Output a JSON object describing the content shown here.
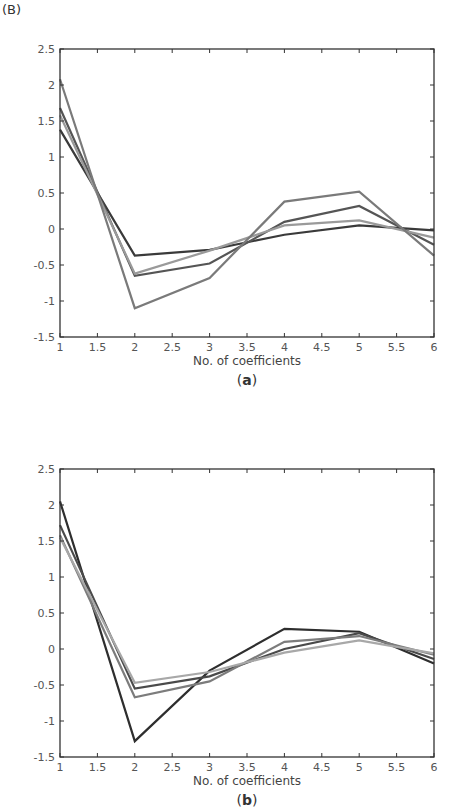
{
  "figure_label": "(B)",
  "chart_data": [
    {
      "type": "line",
      "caption": "(a)",
      "title": "",
      "xlabel": "No. of coefficients",
      "ylabel": "",
      "x": [
        1,
        2,
        3,
        4,
        5,
        6
      ],
      "xlim": [
        1,
        6
      ],
      "ylim": [
        -1.5,
        2.5
      ],
      "xticks": [
        "1",
        "1.5",
        "2",
        "2.5",
        "3",
        "3.5",
        "4",
        "4.5",
        "5",
        "5.5",
        "6"
      ],
      "yticks": [
        "2.5",
        "2",
        "1.5",
        "1",
        "0.5",
        "0",
        "-0.5",
        "-1",
        "-1.5"
      ],
      "grid": false,
      "legend": "none",
      "series": [
        {
          "name": "series-1",
          "color": "#3a3a3a",
          "values": [
            1.38,
            -0.37,
            -0.29,
            -0.08,
            0.05,
            -0.02
          ]
        },
        {
          "name": "series-2",
          "color": "#555555",
          "values": [
            1.68,
            -0.65,
            -0.48,
            0.1,
            0.32,
            -0.22
          ]
        },
        {
          "name": "series-3",
          "color": "#9a9a9a",
          "values": [
            1.58,
            -0.62,
            -0.3,
            0.05,
            0.12,
            -0.12
          ]
        },
        {
          "name": "series-4",
          "color": "#7a7a7a",
          "values": [
            2.08,
            -1.1,
            -0.68,
            0.38,
            0.52,
            -0.37
          ]
        }
      ]
    },
    {
      "type": "line",
      "caption": "(b)",
      "title": "",
      "xlabel": "No. of coefficients",
      "ylabel": "",
      "x": [
        1,
        2,
        3,
        4,
        5,
        6
      ],
      "xlim": [
        1,
        6
      ],
      "ylim": [
        -1.5,
        2.5
      ],
      "xticks": [
        "1",
        "1.5",
        "2",
        "2.5",
        "3",
        "3.5",
        "4",
        "4.5",
        "5",
        "5.5",
        "6"
      ],
      "yticks": [
        "2.5",
        "2",
        "1.5",
        "1",
        "0.5",
        "0",
        "-0.5",
        "-1",
        "-1.5"
      ],
      "grid": false,
      "legend": "none",
      "series": [
        {
          "name": "series-1",
          "color": "#2e2e2e",
          "values": [
            2.05,
            -1.28,
            -0.3,
            0.28,
            0.24,
            -0.2
          ]
        },
        {
          "name": "series-2",
          "color": "#4a4a4a",
          "values": [
            1.72,
            -0.55,
            -0.38,
            0.0,
            0.22,
            -0.14
          ]
        },
        {
          "name": "series-3",
          "color": "#7c7c7c",
          "values": [
            1.58,
            -0.67,
            -0.45,
            0.1,
            0.18,
            -0.08
          ]
        },
        {
          "name": "series-4",
          "color": "#a8a8a8",
          "values": [
            1.55,
            -0.47,
            -0.32,
            -0.05,
            0.12,
            -0.06
          ]
        }
      ]
    }
  ]
}
